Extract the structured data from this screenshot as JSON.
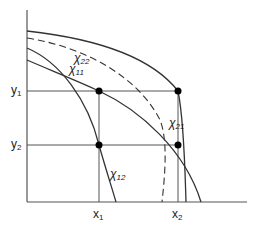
{
  "diagram": {
    "axis_labels": {
      "y1": {
        "base": "y",
        "sub": "1"
      },
      "y2": {
        "base": "y",
        "sub": "2"
      },
      "x1": {
        "base": "x",
        "sub": "1"
      },
      "x2": {
        "base": "x",
        "sub": "2"
      }
    },
    "curve_labels": {
      "chi22": {
        "base": "χ",
        "sub": "22"
      },
      "chi11": {
        "base": "χ",
        "sub": "11"
      },
      "chi21": {
        "base": "χ",
        "sub": "21"
      },
      "chi12": {
        "base": "χ",
        "sub": "12"
      }
    },
    "colors": {
      "line": "#333333",
      "grid": "#555555",
      "dot": "#000000"
    }
  }
}
